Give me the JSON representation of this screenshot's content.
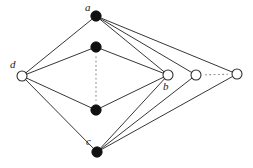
{
  "figure": {
    "type": "undirected-graph-diagram",
    "background_color": "#ffffff",
    "edge_color": "#2b2b2b",
    "filled_node_color": "#111111",
    "hollow_node_fill": "#ffffff",
    "node_stroke_color": "#2b2b2b",
    "dotted_color": "#8a8a8a"
  },
  "nodes": [
    {
      "id": "a",
      "label": "a",
      "x": 96,
      "y": 16,
      "style": "filled",
      "r": 5.2,
      "label_dx": -11,
      "label_dy": -14,
      "labeled": true
    },
    {
      "id": "m1",
      "label": "",
      "x": 96,
      "y": 47,
      "style": "filled",
      "r": 5.2,
      "label_dx": 0,
      "label_dy": 0,
      "labeled": false
    },
    {
      "id": "m2",
      "label": "",
      "x": 96,
      "y": 110,
      "style": "filled",
      "r": 5.2,
      "label_dx": 0,
      "label_dy": 0,
      "labeled": false
    },
    {
      "id": "c",
      "label": "c",
      "x": 97,
      "y": 152,
      "style": "filled",
      "r": 5.2,
      "label_dx": -11,
      "label_dy": -16,
      "labeled": true
    },
    {
      "id": "d",
      "label": "d",
      "x": 22,
      "y": 76,
      "style": "hollow",
      "r": 5.0,
      "label_dx": -12,
      "label_dy": -17,
      "labeled": true
    },
    {
      "id": "b",
      "label": "b",
      "x": 168,
      "y": 75,
      "style": "hollow",
      "r": 5.0,
      "label_dx": -5,
      "label_dy": 6,
      "labeled": true
    },
    {
      "id": "r1",
      "label": "",
      "x": 196,
      "y": 75,
      "style": "hollow",
      "r": 5.0,
      "label_dx": 0,
      "label_dy": 0,
      "labeled": false
    },
    {
      "id": "r2",
      "label": "",
      "x": 237,
      "y": 74,
      "style": "hollow",
      "r": 5.0,
      "label_dx": 0,
      "label_dy": 0,
      "labeled": false
    }
  ],
  "edges": [
    {
      "from": "d",
      "to": "a",
      "style": "solid"
    },
    {
      "from": "d",
      "to": "m1",
      "style": "solid"
    },
    {
      "from": "d",
      "to": "m2",
      "style": "solid"
    },
    {
      "from": "d",
      "to": "c",
      "style": "solid"
    },
    {
      "from": "a",
      "to": "b",
      "style": "solid"
    },
    {
      "from": "a",
      "to": "r1",
      "style": "solid"
    },
    {
      "from": "a",
      "to": "r2",
      "style": "solid"
    },
    {
      "from": "m1",
      "to": "b",
      "style": "solid"
    },
    {
      "from": "m2",
      "to": "b",
      "style": "solid"
    },
    {
      "from": "c",
      "to": "b",
      "style": "solid"
    },
    {
      "from": "c",
      "to": "r1",
      "style": "solid"
    },
    {
      "from": "c",
      "to": "r2",
      "style": "solid"
    }
  ],
  "dotted_connectors": [
    {
      "from": "m1",
      "to": "m2",
      "orientation": "vertical",
      "meaning": "ellipsis-more-nodes"
    },
    {
      "from": "r1",
      "to": "r2",
      "orientation": "horizontal",
      "meaning": "ellipsis-more-nodes"
    }
  ]
}
